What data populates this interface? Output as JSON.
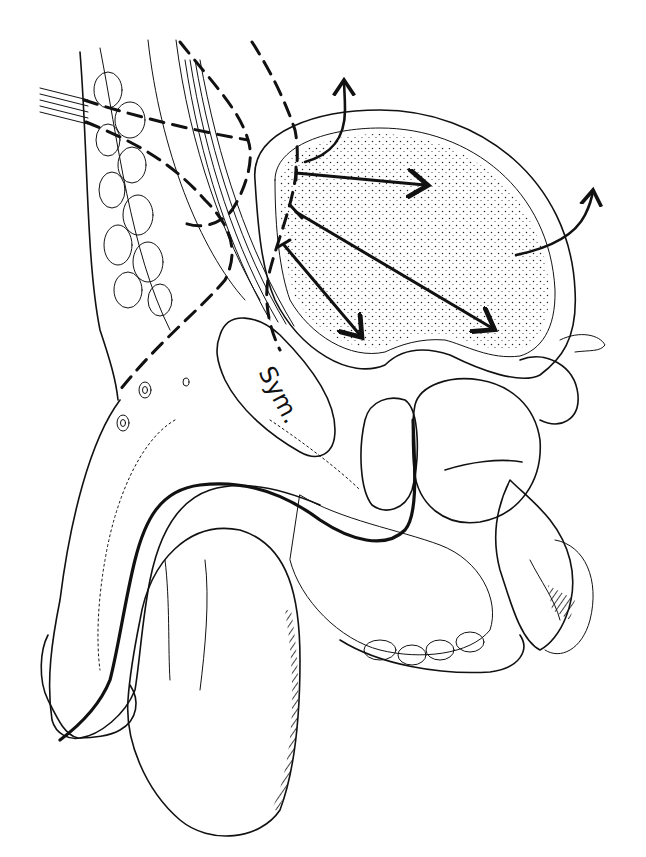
{
  "figure": {
    "type": "anatomical-line-drawing",
    "view": "sagittal section",
    "labels": [
      {
        "id": "symphysis",
        "text": "Sym.",
        "x": 262,
        "y": 378,
        "rotation": 62
      }
    ],
    "arrows": {
      "internal_count": 3,
      "external_count": 2
    },
    "colors": {
      "ink": "#111111",
      "background": "#ffffff"
    }
  }
}
